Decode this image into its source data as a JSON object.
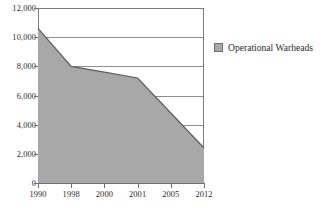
{
  "chart_data": {
    "type": "area",
    "title": "",
    "xlabel": "",
    "ylabel": "",
    "categories": [
      "1990",
      "1998",
      "2000",
      "2001",
      "2005",
      "2012"
    ],
    "series": [
      {
        "name": "Operational Warheads",
        "values": [
          10600,
          8000,
          7600,
          7200,
          4800,
          2400
        ],
        "color": "#a8a8a8"
      }
    ],
    "ylim": [
      0,
      12000
    ],
    "y_ticks": [
      0,
      2000,
      4000,
      6000,
      8000,
      10000,
      12000
    ],
    "y_tick_labels": [
      "0",
      "2,000",
      "4,000",
      "6,000",
      "8,000",
      "10,000",
      "12,000"
    ],
    "grid": true,
    "legend_position": "right",
    "legend": [
      {
        "label": "Operational Warheads",
        "swatch_name": "legend-swatch-operational-warheads"
      }
    ]
  },
  "colors": {
    "area_fill": "#a8a8a8",
    "area_stroke": "#5d5d5d",
    "gridline": "#8d8d8d",
    "axis": "#6f6f6f",
    "text": "#2c2c2c",
    "background": "#ffffff"
  }
}
